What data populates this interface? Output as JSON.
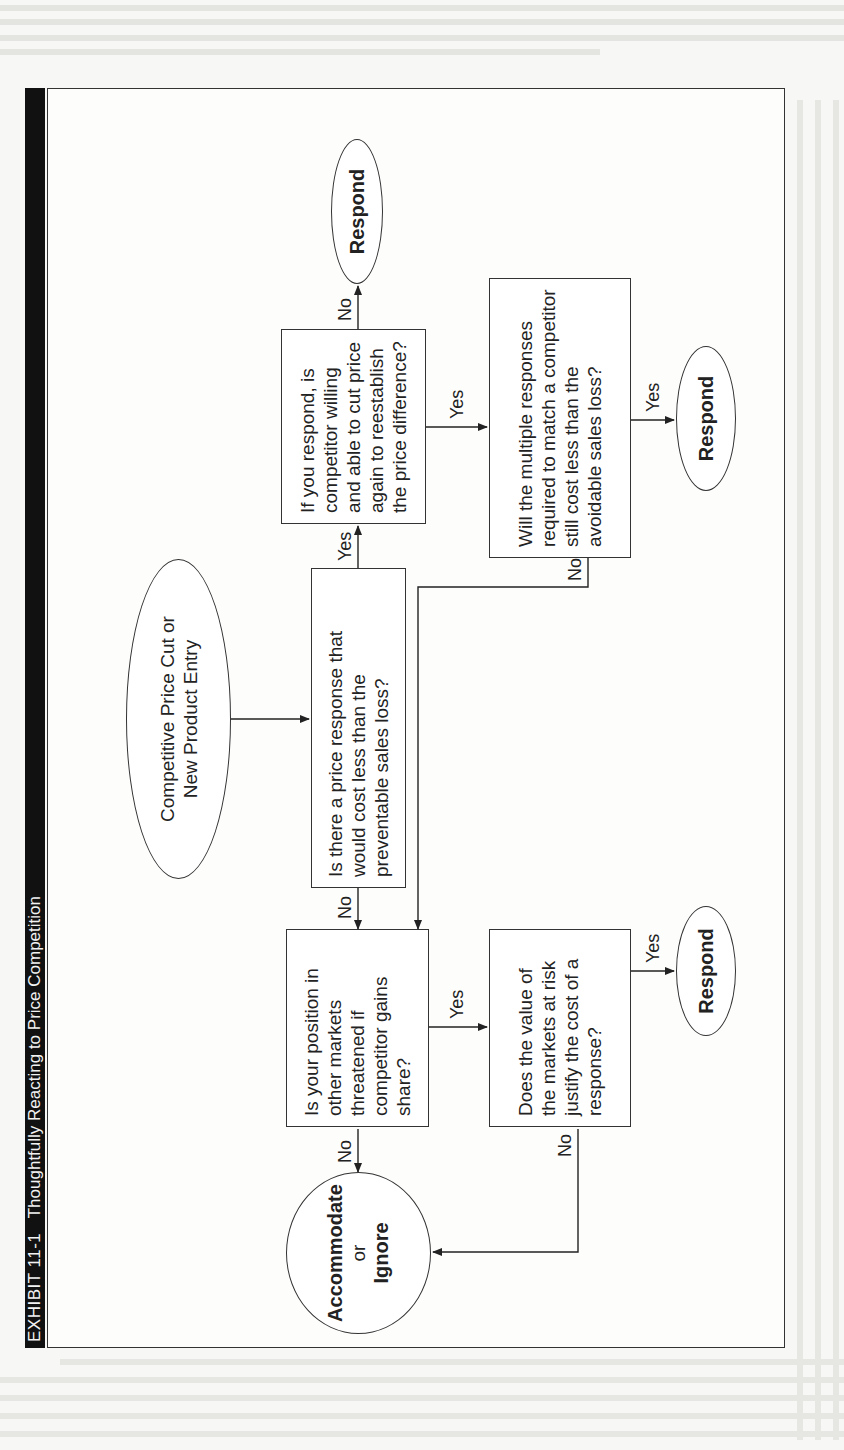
{
  "exhibit": {
    "number": "EXHIBIT 11-1",
    "title": "Thoughtfully Reacting to Price Competition"
  },
  "nodes": {
    "start": "Competitive Price Cut or New Product Entry",
    "q1": "Is there a price response that would cost less than the preventable sales loss?",
    "q2": "If you respond, is competitor willing and able to cut price again to reestablish the price difference?",
    "q3": "Will the multiple responses required to match a competitor still cost less than the avoidable sales loss?",
    "q4": "Is your position in other markets threatened if competitor gains share?",
    "q5": "Does the value of the markets at risk justify the cost of a response?",
    "respond_top": "Respond",
    "respond_mid": "Respond",
    "respond_bottom": "Respond",
    "accommodate": {
      "line1": "Accommodate",
      "line2": "or",
      "line3": "Ignore"
    }
  },
  "edges": [
    {
      "from": "start",
      "to": "q1",
      "label": ""
    },
    {
      "from": "q1",
      "to": "q2",
      "label": "Yes"
    },
    {
      "from": "q1",
      "to": "q4",
      "label": "No"
    },
    {
      "from": "q2",
      "to": "respond_top",
      "label": "No"
    },
    {
      "from": "q2",
      "to": "q3",
      "label": "Yes"
    },
    {
      "from": "q3",
      "to": "respond_mid",
      "label": "Yes"
    },
    {
      "from": "q3",
      "to": "q4",
      "label": "No"
    },
    {
      "from": "q4",
      "to": "accommodate",
      "label": "No"
    },
    {
      "from": "q4",
      "to": "q5",
      "label": "Yes"
    },
    {
      "from": "q5",
      "to": "respond_bottom",
      "label": "Yes"
    },
    {
      "from": "q5",
      "to": "accommodate",
      "label": "No"
    }
  ],
  "labels": {
    "yes": "Yes",
    "no": "No"
  }
}
